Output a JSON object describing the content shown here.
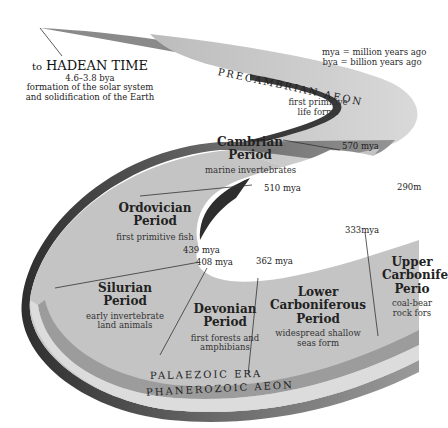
{
  "legend": {
    "mya": "mya = million years ago",
    "bya": "bya = billion years ago"
  },
  "hadean": {
    "prefix": "to",
    "name": "HADEAN TIME",
    "range": "4.6–3.8 bya",
    "desc_line1": "formation of the solar system",
    "desc_line2": "and solidification of the Earth"
  },
  "aeons": {
    "precambrian": "PRECAMBRIAN AEON",
    "precambrian_desc_line1": "first primitive",
    "precambrian_desc_line2": "life forms",
    "phanerozoic": "PHANEROZOIC AEON"
  },
  "eras": {
    "palaeozoic": "PALAEZOIC ERA"
  },
  "periods": [
    {
      "name_line1": "Cambrian",
      "name_line2": "Period",
      "desc_line1": "marine invertebrates",
      "desc_line2": ""
    },
    {
      "name_line1": "Ordovician",
      "name_line2": "Period",
      "desc_line1": "first primitive fish",
      "desc_line2": ""
    },
    {
      "name_line1": "Silurian",
      "name_line2": "Period",
      "desc_line1": "early invertebrate",
      "desc_line2": "land animals"
    },
    {
      "name_line1": "Devonian",
      "name_line2": "Period",
      "desc_line1": "first forests and",
      "desc_line2": "amphibians"
    },
    {
      "name_line1": "Lower",
      "name_line2": "Carboniferous",
      "name_line3": "Period",
      "desc_line1": "widespread shallow",
      "desc_line2": "seas form"
    },
    {
      "name_line1": "Upper",
      "name_line2": "Carbonife",
      "name_line3": "Perio",
      "desc_line1": "coal-bear",
      "desc_line2": "rock fors"
    }
  ],
  "boundaries": {
    "b570": "570 mya",
    "b510": "510 mya",
    "b439": "439 mya",
    "b408": "408 mya",
    "b362": "362 mya",
    "b333": "333mya",
    "b290": "290m"
  },
  "colors": {
    "ribbon_top": "#c8c8c8",
    "ribbon_side": "#4a4a4a",
    "band_dark": "#9a9a9a",
    "band_light": "#d6d6d6",
    "inner_face": "#bdbdbd"
  }
}
